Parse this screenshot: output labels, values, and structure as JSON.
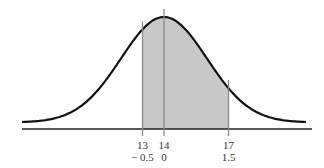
{
  "chart_data": {
    "type": "area",
    "title": "",
    "xlabel": "",
    "ylabel": "",
    "mean": 14,
    "sd": 2,
    "shaded_range": [
      13,
      17
    ],
    "ticks": [
      {
        "x": 13,
        "z": "− 0.5"
      },
      {
        "x": 14,
        "z": "0"
      },
      {
        "x": 17,
        "z": "1.5"
      }
    ],
    "grid": false,
    "legend": null,
    "colors": {
      "curve": "#111111",
      "shade": "#c8c8c8",
      "lines": "#8a8a8a",
      "axis": "#222222"
    }
  }
}
